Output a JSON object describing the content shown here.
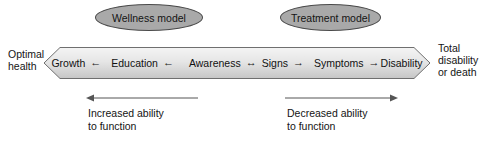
{
  "figure": {
    "colors": {
      "ellipse_fill": "#a9a9a9",
      "ellipse_stroke": "#4a4a4a",
      "band_stroke": "#6b6b6b",
      "band_fill_top": "#f2f2f2",
      "band_fill_bottom": "#c9c9c9",
      "text": "#141414",
      "arrow_line": "#555555",
      "background": "#ffffff"
    }
  },
  "models": [
    {
      "id": "wellness",
      "label": "Wellness model"
    },
    {
      "id": "treatment",
      "label": "Treatment model"
    }
  ],
  "end_labels": {
    "left": {
      "line1": "Optimal",
      "line2": "health"
    },
    "right": {
      "line1": "Total",
      "line2": "disability",
      "line3": "or death"
    }
  },
  "continuum": {
    "stages": [
      {
        "label": "Growth"
      },
      {
        "label": "Education"
      },
      {
        "label": "Awareness"
      },
      {
        "label": "Signs"
      },
      {
        "label": "Symptoms"
      },
      {
        "label": "Disability"
      }
    ],
    "connectors": [
      {
        "between": "Growth-Education",
        "glyph": "←",
        "direction": "left"
      },
      {
        "between": "Education-Awareness",
        "glyph": "←",
        "direction": "left"
      },
      {
        "between": "Awareness-Signs",
        "glyph": "↔",
        "direction": "both"
      },
      {
        "between": "Signs-Symptoms",
        "glyph": "→",
        "direction": "right"
      },
      {
        "between": "Symptoms-Disability",
        "glyph": "→",
        "direction": "right"
      }
    ]
  },
  "annotations": [
    {
      "id": "increased",
      "arrow_direction": "left",
      "line1": "Increased ability",
      "line2": "to function"
    },
    {
      "id": "decreased",
      "arrow_direction": "right",
      "line1": "Decreased ability",
      "line2": "to function"
    }
  ]
}
